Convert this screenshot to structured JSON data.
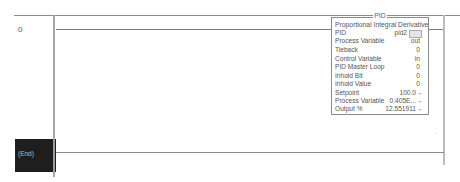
{
  "rungs": [
    {
      "number": "0"
    },
    {
      "number": "",
      "end_label": "(End)"
    }
  ],
  "pid_block": {
    "title": "PID",
    "description": "Proportional Integral Derivative",
    "tag_label": "PID",
    "tag_value": "pid2",
    "rows": [
      {
        "label": "Process Variable",
        "value": "out",
        "arrow": ""
      },
      {
        "label": "Tieback",
        "value": "0",
        "arrow": ""
      },
      {
        "label": "Control Variable",
        "value": "in",
        "arrow": ""
      },
      {
        "label": "PID Master Loop",
        "value": "0",
        "arrow": ""
      },
      {
        "label": "Inhold Bit",
        "value": "0",
        "arrow": ""
      },
      {
        "label": "Inhold Value",
        "value": "0",
        "arrow": ""
      },
      {
        "label": "Setpoint",
        "value": "100.0",
        "arrow": "←"
      },
      {
        "label": "Process Variable",
        "value": "0.405E...",
        "arrow": "←"
      },
      {
        "label": "Output %",
        "value": "12.551911",
        "arrow": "←"
      }
    ]
  }
}
